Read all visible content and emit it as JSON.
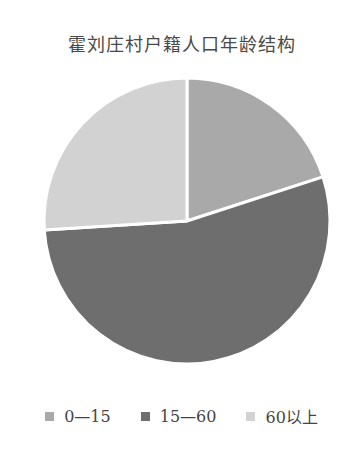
{
  "chart_data": {
    "type": "pie",
    "title": "霍刘庄村户籍人口年龄结构",
    "categories": [
      "0—15",
      "15—60",
      "60以上"
    ],
    "values": [
      20,
      54,
      26
    ],
    "unit": "%",
    "colors": [
      "#a9a9a9",
      "#6e6e6e",
      "#d2d2d2"
    ],
    "start_angle": "12 o'clock",
    "direction": "clockwise",
    "legend_position": "bottom"
  },
  "legend": [
    {
      "label": "0—15",
      "color": "#a9a9a9"
    },
    {
      "label": "15—60",
      "color": "#6e6e6e"
    },
    {
      "label": "60以上",
      "color": "#d2d2d2"
    }
  ]
}
